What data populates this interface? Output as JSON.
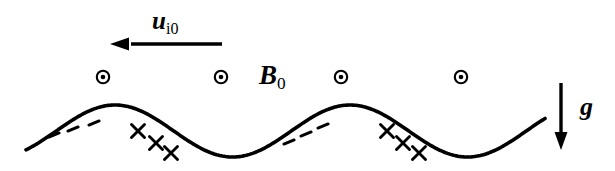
{
  "figure": {
    "background_color": "#ffffff",
    "ink_color": "#000000",
    "width": 615,
    "height": 171
  },
  "labels": {
    "drift_velocity": {
      "symbol": "u",
      "subscript": "i0",
      "full": "ui0",
      "meaning": "ion drift velocity"
    },
    "magnetic_field": {
      "symbol": "B",
      "subscript": "0",
      "full": "B0",
      "meaning": "ambient magnetic field out of page"
    },
    "gravity": {
      "symbol": "g",
      "subscript": "",
      "full": "g",
      "meaning": "gravitational acceleration"
    }
  },
  "arrows": {
    "drift_arrow": {
      "name": "u-i0-arrow",
      "direction": "left",
      "x_start": 222,
      "x_end": 110,
      "y": 44,
      "stroke_width": 3.4,
      "head_length": 19,
      "head_half_width": 6.5
    },
    "gravity_arrow": {
      "name": "g-arrow",
      "direction": "down",
      "x": 561,
      "y_start": 83,
      "y_end": 150,
      "stroke_width": 3.4,
      "head_length": 18,
      "head_half_width": 6.5
    }
  },
  "field_markers": {
    "glyph": "circle-dot",
    "meaning": "magnetic field directed out of the page",
    "outer_radius": 6.2,
    "inner_radius": 2.3,
    "ring_width": 2.1,
    "positions": [
      {
        "x": 103,
        "y": 77
      },
      {
        "x": 221,
        "y": 77
      },
      {
        "x": 341,
        "y": 77
      },
      {
        "x": 461,
        "y": 77
      }
    ]
  },
  "interface_curve": {
    "name": "perturbed-interface",
    "shape": "sinusoid",
    "stroke_width": 3.6,
    "x_start": 26,
    "x_end": 545,
    "mean_y": 131,
    "amplitude": 26,
    "wavelength": 235,
    "phase_x_first_crest": 115,
    "crests": [
      {
        "x": 115,
        "y": 105
      },
      {
        "x": 350,
        "y": 104
      }
    ],
    "troughs": [
      {
        "x": 215,
        "y": 158
      },
      {
        "x": 455,
        "y": 158
      }
    ]
  },
  "charge_markers": {
    "negative": {
      "glyph": "dash",
      "meaning": "negative surface charge",
      "length": 11,
      "stroke_width": 3.0,
      "tilt_deg": -22,
      "positions": [
        {
          "x": 54,
          "y": 135
        },
        {
          "x": 73,
          "y": 129
        },
        {
          "x": 94,
          "y": 123
        },
        {
          "x": 289,
          "y": 142
        },
        {
          "x": 306,
          "y": 134
        },
        {
          "x": 323,
          "y": 126
        }
      ]
    },
    "positive": {
      "glyph": "cross",
      "meaning": "positive surface charge",
      "size": 13,
      "stroke_width": 2.9,
      "positions": [
        {
          "x": 138,
          "y": 131
        },
        {
          "x": 156,
          "y": 143
        },
        {
          "x": 171,
          "y": 153
        },
        {
          "x": 387,
          "y": 131
        },
        {
          "x": 403,
          "y": 143
        },
        {
          "x": 419,
          "y": 153
        }
      ]
    }
  }
}
